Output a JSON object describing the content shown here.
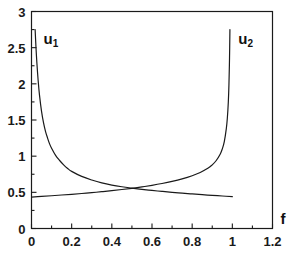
{
  "chart_data": {
    "type": "line",
    "title": "",
    "subtitle": "",
    "xlabel": "f",
    "ylabel": "",
    "xlim": [
      0,
      1.2
    ],
    "ylim": [
      0,
      3
    ],
    "xticks": [
      "0",
      "0.2",
      "0.4",
      "0.6",
      "0.8",
      "1",
      "1.2"
    ],
    "xtick_values": [
      0,
      0.2,
      0.4,
      0.6,
      0.8,
      1.0,
      1.2
    ],
    "yticks": [
      "0",
      "0.5",
      "1",
      "1.5",
      "2",
      "2.5",
      "3"
    ],
    "ytick_values": [
      0,
      0.5,
      1.0,
      1.5,
      2.0,
      2.5,
      3.0
    ],
    "grid": false,
    "legend_position": "inline-annotation",
    "annotations": [
      {
        "text": "u",
        "sub": "1",
        "x": 0.06,
        "y": 2.62
      },
      {
        "text": "u",
        "sub": "2",
        "x": 1.03,
        "y": 2.62
      }
    ],
    "series": [
      {
        "name": "u1",
        "label": "u₁",
        "color": "#1a1a1a",
        "x": [
          0.018,
          0.022,
          0.027,
          0.033,
          0.04,
          0.05,
          0.06,
          0.07,
          0.08,
          0.09,
          0.1,
          0.12,
          0.14,
          0.16,
          0.18,
          0.2,
          0.25,
          0.3,
          0.35,
          0.4,
          0.45,
          0.5,
          0.55,
          0.6,
          0.65,
          0.7,
          0.75,
          0.8,
          0.85,
          0.9,
          0.95,
          1.0
        ],
        "y": [
          2.75,
          2.52,
          2.28,
          2.05,
          1.84,
          1.62,
          1.46,
          1.34,
          1.25,
          1.17,
          1.11,
          1.01,
          0.94,
          0.88,
          0.83,
          0.79,
          0.72,
          0.67,
          0.63,
          0.6,
          0.577,
          0.558,
          0.541,
          0.526,
          0.513,
          0.5,
          0.489,
          0.478,
          0.468,
          0.458,
          0.449,
          0.44
        ]
      },
      {
        "name": "u2",
        "label": "u₂",
        "color": "#1a1a1a",
        "x": [
          0.0,
          0.05,
          0.1,
          0.15,
          0.2,
          0.25,
          0.3,
          0.35,
          0.4,
          0.45,
          0.5,
          0.55,
          0.6,
          0.65,
          0.7,
          0.75,
          0.8,
          0.84,
          0.88,
          0.9,
          0.92,
          0.94,
          0.95,
          0.96,
          0.97,
          0.975,
          0.98,
          0.983,
          0.986,
          0.988
        ],
        "y": [
          0.435,
          0.444,
          0.453,
          0.463,
          0.473,
          0.484,
          0.496,
          0.509,
          0.523,
          0.539,
          0.556,
          0.575,
          0.597,
          0.622,
          0.651,
          0.686,
          0.73,
          0.775,
          0.835,
          0.88,
          0.94,
          1.03,
          1.1,
          1.2,
          1.38,
          1.52,
          1.75,
          1.98,
          2.35,
          2.75
        ]
      }
    ]
  },
  "axes": {
    "x_axis_name": "f",
    "frame_color": "#1a1a1a"
  }
}
